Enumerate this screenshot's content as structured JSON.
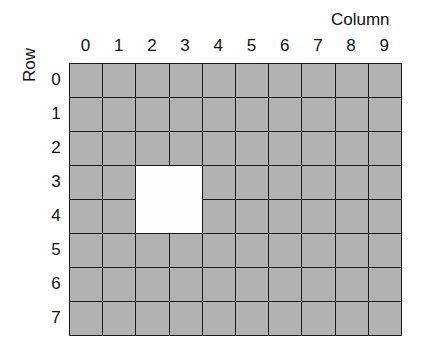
{
  "diagram": {
    "column_title": "Column",
    "row_title": "Row",
    "columns": [
      "0",
      "1",
      "2",
      "3",
      "4",
      "5",
      "6",
      "7",
      "8",
      "9"
    ],
    "rows": [
      "0",
      "1",
      "2",
      "3",
      "4",
      "5",
      "6",
      "7"
    ],
    "colors": {
      "cell_fill": "#a9a9a9",
      "hole_fill": "#fdfdfd",
      "grid_line": "#1a1a1a"
    },
    "hole": {
      "rows": [
        3,
        4
      ],
      "columns": [
        2,
        3
      ],
      "description": "2x2 empty (white) region at rows 3-4, columns 2-3"
    }
  }
}
